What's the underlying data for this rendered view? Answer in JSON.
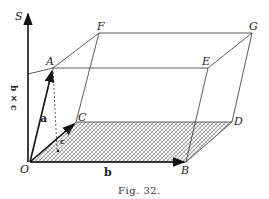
{
  "figure": {
    "caption": "Fig. 32.",
    "points": {
      "O": "O",
      "A": "A",
      "B": "B",
      "C": "C",
      "D": "D",
      "E": "E",
      "F": "F",
      "G": "G",
      "S": "S"
    },
    "vectors": {
      "a": "a",
      "b": "b",
      "c": "c",
      "bxc": "b × c"
    }
  }
}
